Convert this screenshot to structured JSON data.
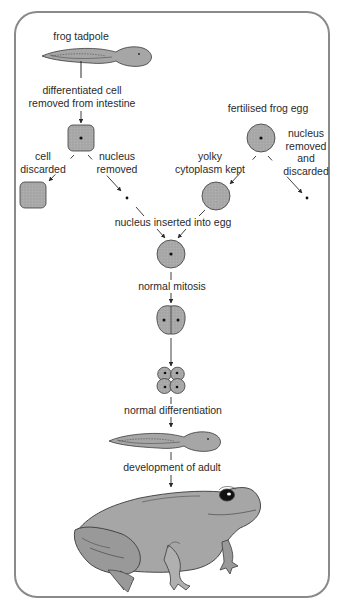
{
  "diagram": {
    "colors": {
      "frame": "#8a8a8a",
      "cell_fill": "#a9a9a9",
      "organism_fill": "#a6a6a6",
      "outline": "#3a3a3a",
      "text": "#2a2a2a"
    },
    "labels": {
      "frog_tadpole": "frog tadpole",
      "differentiated_cell_1": "differentiated cell",
      "differentiated_cell_2": "removed from intestine",
      "fertilised_egg": "fertilised frog egg",
      "cell_discarded_1": "cell",
      "cell_discarded_2": "discarded",
      "nucleus_removed_left_1": "nucleus",
      "nucleus_removed_left_2": "removed",
      "nucleus_removed_right_1": "nucleus",
      "nucleus_removed_right_2": "removed",
      "nucleus_removed_right_3": "and",
      "nucleus_removed_right_4": "discarded",
      "yolky_1": "yolky",
      "yolky_2": "cytoplasm kept",
      "nucleus_inserted": "nucleus inserted into egg",
      "normal_mitosis": "normal mitosis",
      "normal_differentiation": "normal differentiation",
      "development_of_adult": "development of adult"
    },
    "stages": [
      "frog tadpole",
      "intestine cell",
      "fertilised frog egg",
      "enucleated egg",
      "egg with transplanted nucleus",
      "2-cell embryo",
      "4-cell embryo",
      "tadpole",
      "adult frog"
    ]
  }
}
